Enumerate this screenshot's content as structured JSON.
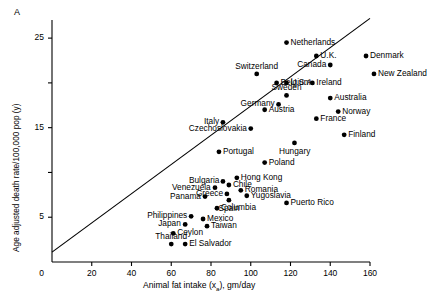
{
  "figure": {
    "panel_label": "A"
  },
  "chart_data": {
    "type": "scatter",
    "title": "",
    "xlabel": "Animal fat intake (xa), gm/day",
    "xlabel_main": "Animal fat intake (x",
    "xlabel_sub": "a",
    "xlabel_tail": "), gm/day",
    "ylabel": "Age adjusted death rate/100,000 pop (y)",
    "xlim": [
      0,
      160
    ],
    "ylim": [
      0,
      27
    ],
    "grid": false,
    "legend": "none",
    "xticks": [
      0,
      20,
      40,
      60,
      80,
      100,
      120,
      140,
      160
    ],
    "xticklabels": [
      "0",
      "20",
      "40",
      "60",
      "80",
      "100",
      "120",
      "140",
      "160"
    ],
    "yticks": [
      5,
      10,
      15,
      20,
      25
    ],
    "yticklabels": [
      "5",
      "",
      "15",
      "",
      "25"
    ],
    "ytick_labeled": [
      "5",
      "15",
      "25"
    ],
    "y_axis_zero_label": "0",
    "trendline": {
      "x0": 0,
      "y0": 1.1,
      "x1": 160,
      "y1": 27.2
    },
    "points": [
      {
        "name": "Netherlands",
        "x": 118,
        "y": 24.5,
        "lx": "right"
      },
      {
        "name": "U.K.",
        "x": 133,
        "y": 23.0,
        "lx": "right"
      },
      {
        "name": "Denmark",
        "x": 158,
        "y": 23.0,
        "lx": "right"
      },
      {
        "name": "Canada",
        "x": 140,
        "y": 22.0,
        "lx": "left"
      },
      {
        "name": "New Zealand",
        "x": 162,
        "y": 21.0,
        "lx": "right"
      },
      {
        "name": "Switzerland",
        "x": 103,
        "y": 21.0,
        "lx": "above"
      },
      {
        "name": "Belgium",
        "x": 113,
        "y": 20.0,
        "lx": "right"
      },
      {
        "name": "U.S.A.",
        "x": 118,
        "y": 20.0,
        "lx": "right"
      },
      {
        "name": "Ireland",
        "x": 131,
        "y": 20.0,
        "lx": "right"
      },
      {
        "name": "Sweden",
        "x": 118,
        "y": 18.6,
        "lx": "above"
      },
      {
        "name": "Australia",
        "x": 140,
        "y": 18.3,
        "lx": "right"
      },
      {
        "name": "Germany",
        "x": 114,
        "y": 17.6,
        "lx": "left"
      },
      {
        "name": "Austria",
        "x": 107,
        "y": 17.0,
        "lx": "right"
      },
      {
        "name": "Norway",
        "x": 144,
        "y": 16.8,
        "lx": "right"
      },
      {
        "name": "France",
        "x": 133,
        "y": 16.0,
        "lx": "right"
      },
      {
        "name": "Italy",
        "x": 86,
        "y": 15.6,
        "lx": "left"
      },
      {
        "name": "Czechoslovakia",
        "x": 100,
        "y": 14.9,
        "lx": "left"
      },
      {
        "name": "Finland",
        "x": 147,
        "y": 14.2,
        "lx": "right"
      },
      {
        "name": "Hungary",
        "x": 122,
        "y": 13.3,
        "lx": "below"
      },
      {
        "name": "Portugal",
        "x": 84,
        "y": 12.3,
        "lx": "right"
      },
      {
        "name": "Poland",
        "x": 107,
        "y": 11.1,
        "lx": "right"
      },
      {
        "name": "Hong Kong",
        "x": 93,
        "y": 9.4,
        "lx": "right"
      },
      {
        "name": "Bulgaria",
        "x": 86,
        "y": 9.0,
        "lx": "left"
      },
      {
        "name": "Chile",
        "x": 89,
        "y": 8.6,
        "lx": "right"
      },
      {
        "name": "Venezuela",
        "x": 82,
        "y": 8.3,
        "lx": "left"
      },
      {
        "name": "Romania",
        "x": 95,
        "y": 8.0,
        "lx": "right"
      },
      {
        "name": "Greece",
        "x": 88,
        "y": 7.6,
        "lx": "left"
      },
      {
        "name": "Yugoslavia",
        "x": 98,
        "y": 7.4,
        "lx": "right"
      },
      {
        "name": "Panama",
        "x": 77,
        "y": 7.3,
        "lx": "left"
      },
      {
        "name": "Spain",
        "x": 89,
        "y": 6.9,
        "lx": "below"
      },
      {
        "name": "Puerto Rico",
        "x": 118,
        "y": 6.6,
        "lx": "right"
      },
      {
        "name": "Columbia",
        "x": 83,
        "y": 6.0,
        "lx": "right"
      },
      {
        "name": "Philippines",
        "x": 70,
        "y": 5.1,
        "lx": "left"
      },
      {
        "name": "Mexico",
        "x": 76,
        "y": 4.8,
        "lx": "right"
      },
      {
        "name": "Japan",
        "x": 67,
        "y": 4.2,
        "lx": "left"
      },
      {
        "name": "Taiwan",
        "x": 78,
        "y": 4.0,
        "lx": "right"
      },
      {
        "name": "Ceylon",
        "x": 61,
        "y": 3.2,
        "lx": "right"
      },
      {
        "name": "Thailand",
        "x": 60,
        "y": 2.0,
        "lx": "above"
      },
      {
        "name": "El Salvador",
        "x": 67,
        "y": 2.0,
        "lx": "right"
      }
    ]
  }
}
